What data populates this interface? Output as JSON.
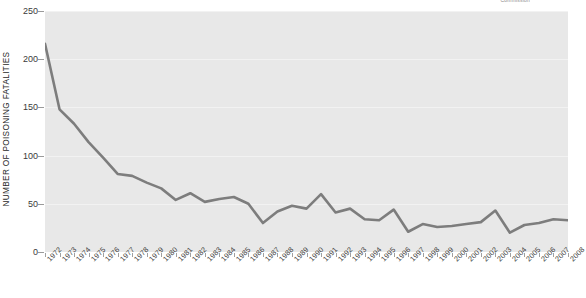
{
  "corner_note": "Commission",
  "chart_data": {
    "type": "line",
    "title": "",
    "xlabel": "",
    "ylabel": "NUMBER OF POISONING FATALITIES",
    "ylim": [
      0,
      250
    ],
    "yticks": [
      0,
      50,
      100,
      150,
      200,
      250
    ],
    "grid": true,
    "legend": "none",
    "line_color": "#7d7d7d",
    "plot_background": "#e8e8e8",
    "categories": [
      "1972",
      "1973",
      "1974",
      "1975",
      "1976",
      "1977",
      "1978",
      "1979",
      "1980",
      "1981",
      "1982",
      "1983",
      "1984",
      "1985",
      "1986",
      "1987",
      "1988",
      "1989",
      "1990",
      "1991",
      "1992",
      "1993",
      "1994",
      "1995",
      "1996",
      "1997",
      "1998",
      "1999",
      "2000",
      "2001",
      "2002",
      "2003",
      "2004",
      "2005",
      "2006",
      "2007",
      "2008"
    ],
    "values": [
      216,
      148,
      133,
      114,
      98,
      81,
      79,
      72,
      66,
      54,
      61,
      52,
      55,
      57,
      50,
      30,
      42,
      48,
      45,
      60,
      41,
      45,
      34,
      33,
      44,
      21,
      29,
      26,
      27,
      29,
      31,
      43,
      20,
      28,
      30,
      34,
      33
    ]
  }
}
